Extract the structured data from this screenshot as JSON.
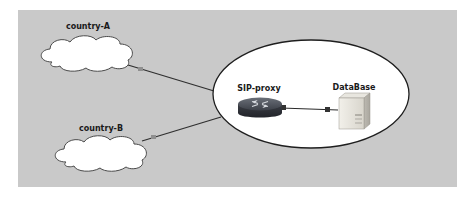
{
  "diagram": {
    "type": "network-topology",
    "background_color": "#c9c9c9",
    "nodes": [
      {
        "id": "country-A",
        "label": "country-A",
        "shape": "cloud"
      },
      {
        "id": "country-B",
        "label": "country-B",
        "shape": "cloud"
      },
      {
        "id": "sip-proxy",
        "label": "SIP-proxy",
        "shape": "router",
        "group": "core"
      },
      {
        "id": "database",
        "label": "DataBase",
        "shape": "server",
        "group": "core"
      }
    ],
    "groups": [
      {
        "id": "core",
        "shape": "ellipse",
        "members": [
          "sip-proxy",
          "database"
        ]
      }
    ],
    "edges": [
      {
        "from": "country-A",
        "to": "core"
      },
      {
        "from": "country-B",
        "to": "core"
      },
      {
        "from": "sip-proxy",
        "to": "database"
      }
    ]
  }
}
